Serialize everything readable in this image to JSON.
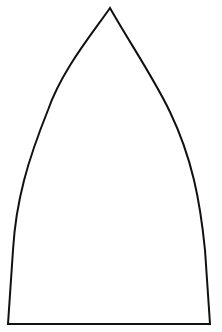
{
  "diagram": {
    "canvas": {
      "width": 222,
      "height": 332,
      "background": "#ffffff"
    },
    "shape": {
      "name": "pointed-arch-outline",
      "stroke": "#111111",
      "stroke_width": 2,
      "fill": "#ffffff",
      "apex": [
        110,
        8
      ],
      "bottom_left": [
        8,
        324
      ],
      "bottom_right": [
        210,
        324
      ],
      "path": "M 110 8 C 92 34, 62 70, 48 110 C 28 160, 16 200, 13 250 L 8 324 L 210 324 L 205 250 C 200 200, 192 158, 170 112 C 155 80, 128 40, 110 8 Z"
    }
  }
}
